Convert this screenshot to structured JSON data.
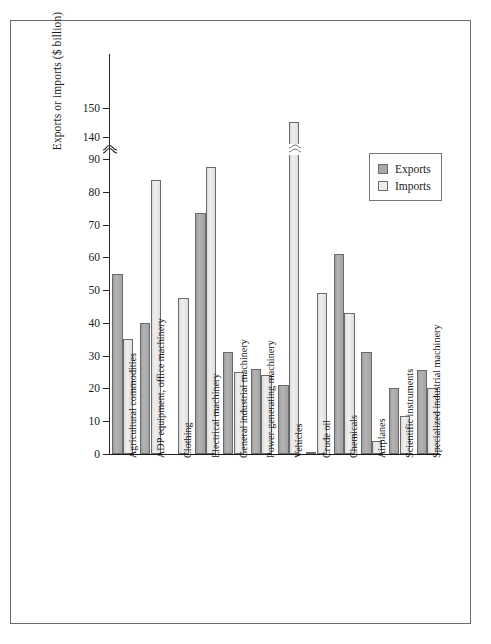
{
  "chart_data": {
    "type": "bar",
    "title": "",
    "xlabel": "",
    "ylabel": "Exports or imports ($ billion)",
    "ylim": [
      0,
      150
    ],
    "grid": false,
    "legend_position": "upper-right",
    "y_ticks": [
      0,
      10,
      20,
      30,
      40,
      50,
      60,
      70,
      80,
      90,
      140,
      150
    ],
    "y_tick_labels": [
      "0",
      "10",
      "20",
      "30",
      "40",
      "50",
      "60",
      "70",
      "80",
      "90",
      "140",
      "150"
    ],
    "axis_break": {
      "from": 90,
      "to": 140,
      "symbol": "squiggle"
    },
    "categories": [
      "Agricultural commodities",
      "ADP equipment, office machinery",
      "Clothing",
      "Electrical machinery",
      "General industrial machinery",
      "Power-generating machinery",
      "Vehicles",
      "Crude oil",
      "Chemicals",
      "Airplanes",
      "Scientific instruments",
      "Specialized industrial machinery"
    ],
    "series": [
      {
        "name": "Exports",
        "color": "#a8a8a8",
        "values": [
          55,
          40,
          0,
          73.5,
          31,
          26,
          21,
          0.7,
          61,
          31,
          20,
          25.5
        ]
      },
      {
        "name": "Imports",
        "color": "#ececec",
        "values": [
          35,
          83.5,
          47.5,
          87.5,
          25,
          24,
          145,
          49,
          43,
          4,
          11.5,
          20
        ]
      }
    ]
  },
  "legend": {
    "items": [
      {
        "label": "Exports",
        "swatch": "exports-swatch"
      },
      {
        "label": "Imports",
        "swatch": "imports-swatch"
      }
    ]
  }
}
